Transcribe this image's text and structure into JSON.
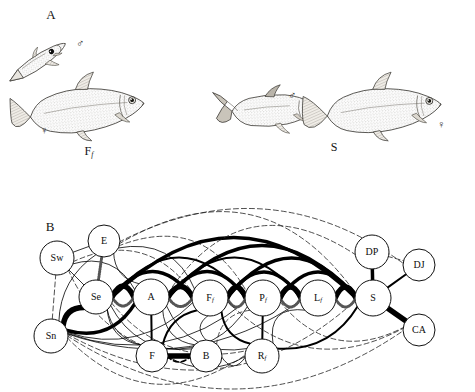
{
  "figure": {
    "panels": [
      {
        "id": "A",
        "letter": "A",
        "letter_pos": {
          "x": 51,
          "y": 16
        },
        "caption_left": "F",
        "caption_left_sub": "f",
        "caption_left_pos": {
          "x": 89,
          "y": 152
        },
        "caption_right": "S",
        "caption_right_pos": {
          "x": 334,
          "y": 148
        },
        "symbols": [
          {
            "name": "male-symbol-left",
            "glyph": "♂",
            "x": 80,
            "y": 44
          },
          {
            "name": "female-symbol-left",
            "glyph": "♀",
            "x": 44,
            "y": 131
          },
          {
            "name": "male-symbol-right",
            "glyph": "♂",
            "x": 292,
            "y": 96
          },
          {
            "name": "female-symbol-right",
            "glyph": "♀",
            "x": 441,
            "y": 125
          }
        ]
      },
      {
        "id": "B",
        "letter": "B",
        "letter_pos": {
          "x": 50,
          "y": 228
        }
      }
    ]
  },
  "chart_data": {
    "type": "diagram",
    "title": "",
    "subtype": "node-link ethogram network",
    "nodes": [
      {
        "id": "Sw",
        "label": "Sw",
        "sub": "",
        "x": 57,
        "y": 258,
        "r": 17
      },
      {
        "id": "E",
        "label": "E",
        "sub": "",
        "x": 104,
        "y": 241,
        "r": 16
      },
      {
        "id": "Se",
        "label": "Se",
        "sub": "",
        "x": 96,
        "y": 297,
        "r": 17
      },
      {
        "id": "Sn",
        "label": "Sn",
        "sub": "",
        "x": 51,
        "y": 336,
        "r": 17
      },
      {
        "id": "A",
        "label": "A",
        "sub": "",
        "x": 151,
        "y": 297,
        "r": 18
      },
      {
        "id": "F",
        "label": "F",
        "sub": "",
        "x": 152,
        "y": 356,
        "r": 16
      },
      {
        "id": "B",
        "label": "B",
        "sub": "",
        "x": 206,
        "y": 356,
        "r": 16
      },
      {
        "id": "Ff",
        "label": "F",
        "sub": "f",
        "x": 210,
        "y": 298,
        "r": 18
      },
      {
        "id": "Pf",
        "label": "P",
        "sub": "f",
        "x": 263,
        "y": 298,
        "r": 18
      },
      {
        "id": "Rf",
        "label": "R",
        "sub": "f",
        "x": 262,
        "y": 356,
        "r": 17
      },
      {
        "id": "Lf",
        "label": "L",
        "sub": "f",
        "x": 318,
        "y": 298,
        "r": 18
      },
      {
        "id": "S",
        "label": "S",
        "sub": "",
        "x": 373,
        "y": 298,
        "r": 18
      },
      {
        "id": "DP",
        "label": "DP",
        "sub": "",
        "x": 372,
        "y": 252,
        "r": 17
      },
      {
        "id": "DJ",
        "label": "DJ",
        "sub": "",
        "x": 419,
        "y": 265,
        "r": 16
      },
      {
        "id": "CA",
        "label": "CA",
        "sub": "",
        "x": 419,
        "y": 330,
        "r": 16
      }
    ],
    "edge_styles": {
      "very-thick": {
        "width": 5.5,
        "dash": "none",
        "color": "#000000"
      },
      "thick": {
        "width": 3.5,
        "dash": "none",
        "color": "#000000"
      },
      "medium": {
        "width": 2.0,
        "dash": "none",
        "color": "#000000"
      },
      "thin": {
        "width": 0.8,
        "dash": "none",
        "color": "#000000"
      },
      "dashed": {
        "width": 0.8,
        "dash": "5,3",
        "color": "#222222"
      },
      "dashed-bold": {
        "width": 1.6,
        "dash": "5,3",
        "color": "#000000"
      },
      "stippled": {
        "width": 3.0,
        "dash": "1,1.6",
        "color": "#555555"
      }
    },
    "edges": [
      {
        "from": "Sw",
        "to": "Se",
        "style": "thin",
        "curve": 0
      },
      {
        "from": "Sw",
        "to": "Sn",
        "style": "dashed",
        "curve": 0
      },
      {
        "from": "Sw",
        "to": "A",
        "style": "thin",
        "curve": -14
      },
      {
        "from": "Sw",
        "to": "Ff",
        "style": "dashed",
        "curve": -26
      },
      {
        "from": "Sw",
        "to": "E",
        "style": "thin",
        "curve": 0
      },
      {
        "from": "Sw",
        "to": "F",
        "style": "dashed",
        "curve": 10
      },
      {
        "from": "E",
        "to": "Se",
        "style": "stippled",
        "curve": 0
      },
      {
        "from": "E",
        "to": "A",
        "style": "thin",
        "curve": 8
      },
      {
        "from": "E",
        "to": "Ff",
        "style": "thin",
        "curve": -18
      },
      {
        "from": "E",
        "to": "Pf",
        "style": "dashed",
        "curve": -30
      },
      {
        "from": "E",
        "to": "S",
        "style": "dashed",
        "curve": -56
      },
      {
        "from": "E",
        "to": "DJ",
        "style": "dashed",
        "curve": -44
      },
      {
        "from": "E",
        "to": "Sn",
        "style": "thin",
        "curve": 10
      },
      {
        "from": "Se",
        "to": "A",
        "style": "very-thick",
        "curve": -11
      },
      {
        "from": "Se",
        "to": "A",
        "style": "stippled",
        "curve": 9
      },
      {
        "from": "Se",
        "to": "Ff",
        "style": "thick",
        "curve": -26
      },
      {
        "from": "Se",
        "to": "Pf",
        "style": "medium",
        "curve": -40
      },
      {
        "from": "Se",
        "to": "S",
        "style": "thick",
        "curve": -60
      },
      {
        "from": "Se",
        "to": "F",
        "style": "thin",
        "curve": 8
      },
      {
        "from": "Se",
        "to": "B",
        "style": "thin",
        "curve": 16
      },
      {
        "from": "Se",
        "to": "Sn",
        "style": "very-thick",
        "curve": 6
      },
      {
        "from": "Se",
        "to": "Rf",
        "style": "dashed",
        "curve": 22
      },
      {
        "from": "Sn",
        "to": "A",
        "style": "thick",
        "curve": 14
      },
      {
        "from": "Sn",
        "to": "Ff",
        "style": "thin",
        "curve": 20
      },
      {
        "from": "Sn",
        "to": "Pf",
        "style": "thin",
        "curve": 26
      },
      {
        "from": "Sn",
        "to": "Lf",
        "style": "thin",
        "curve": 30
      },
      {
        "from": "Sn",
        "to": "Rf",
        "style": "dashed",
        "curve": 38
      },
      {
        "from": "Sn",
        "to": "S",
        "style": "dashed",
        "curve": 52
      },
      {
        "from": "Sn",
        "to": "CA",
        "style": "dashed",
        "curve": 56
      },
      {
        "from": "A",
        "to": "Ff",
        "style": "very-thick",
        "curve": -11
      },
      {
        "from": "A",
        "to": "Ff",
        "style": "stippled",
        "curve": 9
      },
      {
        "from": "A",
        "to": "Pf",
        "style": "thick",
        "curve": -26
      },
      {
        "from": "A",
        "to": "Lf",
        "style": "medium",
        "curve": -40
      },
      {
        "from": "A",
        "to": "S",
        "style": "thick",
        "curve": -52
      },
      {
        "from": "A",
        "to": "F",
        "style": "medium",
        "curve": 0
      },
      {
        "from": "A",
        "to": "B",
        "style": "thin",
        "curve": 10
      },
      {
        "from": "A",
        "to": "Rf",
        "style": "thin",
        "curve": 18
      },
      {
        "from": "A",
        "to": "DP",
        "style": "dashed",
        "curve": -48
      },
      {
        "from": "F",
        "to": "B",
        "style": "very-thick",
        "curve": 0
      },
      {
        "from": "F",
        "to": "B",
        "style": "dashed-bold",
        "curve": 6
      },
      {
        "from": "F",
        "to": "Ff",
        "style": "medium",
        "curve": -8
      },
      {
        "from": "F",
        "to": "Pf",
        "style": "thin",
        "curve": 14
      },
      {
        "from": "F",
        "to": "Rf",
        "style": "thin",
        "curve": 12
      },
      {
        "from": "F",
        "to": "Se",
        "style": "thin",
        "curve": -10
      },
      {
        "from": "B",
        "to": "Ff",
        "style": "thin",
        "curve": -8
      },
      {
        "from": "B",
        "to": "Rf",
        "style": "thin",
        "curve": 10
      },
      {
        "from": "B",
        "to": "Pf",
        "style": "dashed",
        "curve": -10
      },
      {
        "from": "Ff",
        "to": "Pf",
        "style": "very-thick",
        "curve": -11
      },
      {
        "from": "Ff",
        "to": "Pf",
        "style": "stippled",
        "curve": 9
      },
      {
        "from": "Ff",
        "to": "Lf",
        "style": "thick",
        "curve": -26
      },
      {
        "from": "Ff",
        "to": "S",
        "style": "thick",
        "curve": -40
      },
      {
        "from": "Ff",
        "to": "Rf",
        "style": "medium",
        "curve": 8
      },
      {
        "from": "Ff",
        "to": "CA",
        "style": "dashed",
        "curve": 34
      },
      {
        "from": "Pf",
        "to": "Lf",
        "style": "very-thick",
        "curve": -11
      },
      {
        "from": "Pf",
        "to": "Lf",
        "style": "stippled",
        "curve": 9
      },
      {
        "from": "Pf",
        "to": "S",
        "style": "thick",
        "curve": -26
      },
      {
        "from": "Pf",
        "to": "Rf",
        "style": "medium",
        "curve": 0
      },
      {
        "from": "Pf",
        "to": "CA",
        "style": "dashed",
        "curve": 26
      },
      {
        "from": "Lf",
        "to": "S",
        "style": "very-thick",
        "curve": -11
      },
      {
        "from": "Lf",
        "to": "S",
        "style": "stippled",
        "curve": 9
      },
      {
        "from": "Lf",
        "to": "Rf",
        "style": "thin",
        "curve": 16
      },
      {
        "from": "Rf",
        "to": "S",
        "style": "medium",
        "curve": 14
      },
      {
        "from": "S",
        "to": "DP",
        "style": "thick",
        "curve": 0
      },
      {
        "from": "S",
        "to": "DJ",
        "style": "medium",
        "curve": 0
      },
      {
        "from": "S",
        "to": "CA",
        "style": "very-thick",
        "curve": 0
      },
      {
        "from": "DP",
        "to": "DJ",
        "style": "dashed",
        "curve": 0
      }
    ]
  }
}
